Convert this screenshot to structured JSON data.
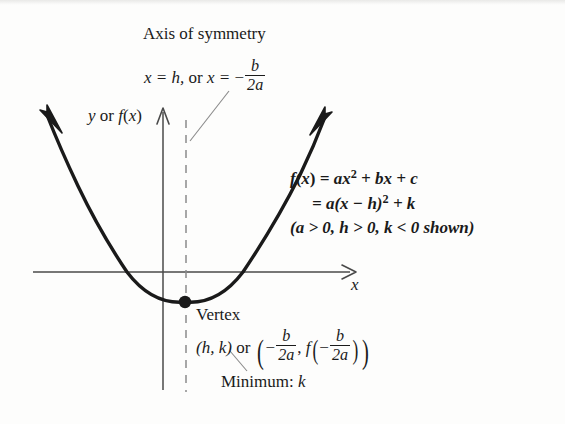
{
  "figure": {
    "kind": "quadratic-function-graph",
    "axis_of_symmetry": {
      "title": "Axis of symmetry",
      "formula_prefix": "x = h,",
      "formula_or": "or",
      "formula_x_equals": "x = ",
      "minus": "−",
      "frac_num": "b",
      "frac_den": "2a"
    },
    "axes": {
      "y_label": "y or f(x)",
      "y_label_parts": {
        "y": "y",
        "or": "or",
        "f": "f",
        "open": "(",
        "x": "x",
        "close": ")"
      },
      "x_label": "x"
    },
    "equations": {
      "line1_f": "f",
      "line1_open": "(",
      "line1_x": "x",
      "line1_close": ")",
      "line1_rest_a": " = ax",
      "line1_exp": "2",
      "line1_rest_b": " + bx + c",
      "line2": "= a(x − h)",
      "line2_exp": "2",
      "line2_rest": " + k",
      "line3": "(a > 0, h > 0, k < 0 shown)"
    },
    "vertex": {
      "title": "Vertex",
      "pair": "(h, k)",
      "or": "or",
      "minus": "−",
      "frac_num": "b",
      "frac_den": "2a",
      "comma": ",",
      "f": "f"
    },
    "minimum": {
      "label": "Minimum:",
      "value": "k"
    },
    "colors": {
      "curve": "#1a1a1a",
      "axis": "#4a4a4a",
      "dashed": "#8a8a8a",
      "leader": "#8a8a8a",
      "text": "#1a1a1a",
      "background": "#fdfdfc"
    },
    "geometry": {
      "x_axis_y": 272,
      "y_axis_x": 163,
      "vertex_point": [
        185,
        302
      ],
      "roots": [
        127,
        243
      ],
      "left_arm_tip": [
        47,
        115
      ],
      "right_arm_tip": [
        325,
        117
      ],
      "symmetry_line_x": 186
    }
  }
}
